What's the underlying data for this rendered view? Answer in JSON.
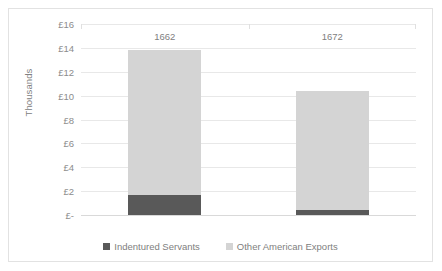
{
  "chart_data": {
    "type": "bar",
    "subtype": "stacked-column",
    "title": "",
    "xlabel": "",
    "ylabel": "Thousands",
    "categories": [
      "1662",
      "1672"
    ],
    "series": [
      {
        "name": "Indentured Servants",
        "color": "#595959",
        "values": [
          1.7,
          0.45
        ]
      },
      {
        "name": "Other American Exports",
        "color": "#d4d4d4",
        "values": [
          12.1,
          9.95
        ]
      }
    ],
    "totals": [
      13.8,
      10.4
    ],
    "ylim": [
      0,
      16
    ],
    "ytick_step": 2,
    "ytick_labels": [
      "£16",
      "£14",
      "£12",
      "£10",
      "£8",
      "£6",
      "£4",
      "£2",
      "£-"
    ],
    "ytick_values": [
      16,
      14,
      12,
      10,
      8,
      6,
      4,
      2,
      0
    ],
    "grid": true,
    "legend_position": "bottom",
    "currency_symbol": "£",
    "units": "Thousands"
  },
  "colors": {
    "series_dark": "#595959",
    "series_light": "#d4d4d4",
    "gridline": "#e8e8e8",
    "axis": "#d9d9d9",
    "text": "#808080",
    "border": "#e2e2e2",
    "background": "#ffffff"
  }
}
